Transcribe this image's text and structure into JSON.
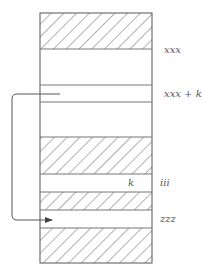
{
  "diagram": {
    "type": "memory-layout",
    "labels": {
      "top_address": "xxx",
      "offset_address": "xxx + k",
      "offset_value": "k",
      "index_address": "iii",
      "target_address": "zzz"
    },
    "bands": [
      {
        "kind": "hatched",
        "y0": 13,
        "y1": 49
      },
      {
        "kind": "empty",
        "y0": 49,
        "y1": 85
      },
      {
        "kind": "empty",
        "y0": 85,
        "y1": 102,
        "label": "xxx + k"
      },
      {
        "kind": "empty",
        "y0": 102,
        "y1": 137
      },
      {
        "kind": "hatched",
        "y0": 137,
        "y1": 174
      },
      {
        "kind": "empty",
        "y0": 174,
        "y1": 192,
        "label": "iii",
        "inner": "k"
      },
      {
        "kind": "hatched",
        "y0": 192,
        "y1": 210
      },
      {
        "kind": "empty",
        "y0": 210,
        "y1": 228,
        "label": "zzz"
      },
      {
        "kind": "hatched",
        "y0": 228,
        "y1": 263
      }
    ],
    "colors": {
      "stroke": "#555555",
      "hatch": "#666666"
    }
  }
}
